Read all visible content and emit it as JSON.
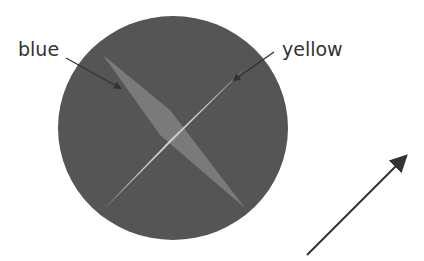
{
  "labels": {
    "blue": "blue",
    "yellow": "yellow"
  },
  "colors": {
    "background": "#ffffff",
    "disc": "#555555",
    "blue_blade": "#7a7a7a",
    "yellow_blade": "#cfcfcf",
    "arrow": "#333333",
    "text": "#333333"
  },
  "diagram": {
    "disc": {
      "cx": 173,
      "cy": 128,
      "rx": 115,
      "ry": 112
    },
    "blue_blade": {
      "from": [
        103,
        55
      ],
      "to": [
        245,
        208
      ]
    },
    "yellow_blade": {
      "from": [
        103,
        210
      ],
      "to": [
        245,
        68
      ]
    },
    "direction_arrow": {
      "from": [
        307,
        255
      ],
      "to": [
        405,
        157
      ]
    }
  }
}
